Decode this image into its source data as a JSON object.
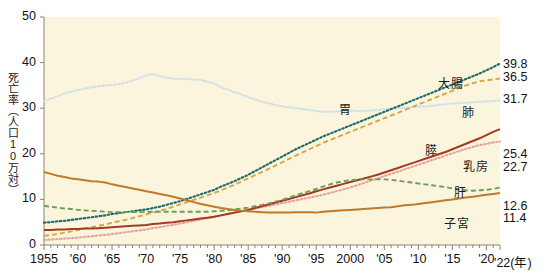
{
  "figure": {
    "background": "#ffffff",
    "plot_background": "#faf5dc",
    "axis_color": "#8a8470"
  },
  "axis": {
    "ylabel": "死亡率（人口10万対）",
    "yticks": [
      "0",
      "10",
      "20",
      "30",
      "40",
      "50"
    ],
    "ylim": [
      0,
      50
    ],
    "xticks": [
      "1955",
      "'60",
      "'65",
      "'70",
      "'75",
      "'80",
      "'85",
      "'90",
      "'95",
      "2000",
      "'05",
      "'10",
      "'15",
      "'20",
      "'22(年)"
    ],
    "xtick_years": [
      1955,
      1960,
      1965,
      1970,
      1975,
      1980,
      1985,
      1990,
      1995,
      2000,
      2005,
      2010,
      2015,
      2020,
      2022
    ],
    "xlim": [
      1955,
      2022
    ],
    "xunit": "(年)",
    "grid": false
  },
  "series_labels": [
    {
      "name": "colorectal-label",
      "text": "大腸",
      "x": 438,
      "y": 74
    },
    {
      "name": "lung-label",
      "text": "肺",
      "x": 462,
      "y": 103
    },
    {
      "name": "stomach-label",
      "text": "胃",
      "x": 339,
      "y": 100
    },
    {
      "name": "pancreas-label",
      "text": "膵",
      "x": 425,
      "y": 141
    },
    {
      "name": "breast-label",
      "text": "乳房",
      "x": 463,
      "y": 157
    },
    {
      "name": "liver-label",
      "text": "肝",
      "x": 454,
      "y": 183
    },
    {
      "name": "uterus-label",
      "text": "子宮",
      "x": 444,
      "y": 214
    }
  ],
  "end_values": [
    {
      "name": "end-value-colorectal",
      "text": "39.8",
      "y": 57
    },
    {
      "name": "end-value-lung",
      "text": "36.5",
      "y": 70
    },
    {
      "name": "end-value-stomach",
      "text": "31.7",
      "y": 92
    },
    {
      "name": "end-value-breast",
      "text": "25.4",
      "y": 147
    },
    {
      "name": "end-value-pancreas",
      "text": "22.7",
      "y": 160
    },
    {
      "name": "end-value-liver",
      "text": "12.6",
      "y": 199
    },
    {
      "name": "end-value-uterus",
      "text": "11.4",
      "y": 211
    }
  ],
  "chart_data": {
    "type": "line",
    "title": "",
    "xlabel": "年",
    "ylabel": "死亡率（人口10万対）",
    "xlim": [
      1955,
      2022
    ],
    "ylim": [
      0,
      50
    ],
    "grid": false,
    "legend": "inline-labels",
    "x": [
      1955,
      1956,
      1957,
      1958,
      1959,
      1960,
      1961,
      1962,
      1963,
      1964,
      1965,
      1966,
      1967,
      1968,
      1969,
      1970,
      1971,
      1972,
      1973,
      1974,
      1975,
      1976,
      1977,
      1978,
      1979,
      1980,
      1981,
      1982,
      1983,
      1984,
      1985,
      1986,
      1987,
      1988,
      1989,
      1990,
      1991,
      1992,
      1993,
      1994,
      1995,
      1996,
      1997,
      1998,
      1999,
      2000,
      2001,
      2002,
      2003,
      2004,
      2005,
      2006,
      2007,
      2008,
      2009,
      2010,
      2011,
      2012,
      2013,
      2014,
      2015,
      2016,
      2017,
      2018,
      2019,
      2020,
      2021,
      2022
    ],
    "series": [
      {
        "name": "胃",
        "name_en": "stomach",
        "color": "#cfe0e8",
        "style": "dotted",
        "end_value": 31.7,
        "values": [
          31.6,
          32.1,
          32.6,
          33.2,
          33.6,
          34.0,
          34.3,
          34.6,
          34.8,
          35.0,
          35.1,
          35.3,
          35.6,
          36.0,
          36.6,
          37.2,
          37.5,
          37.0,
          36.7,
          36.5,
          36.4,
          36.4,
          36.3,
          36.2,
          35.8,
          35.4,
          34.6,
          34.1,
          33.5,
          33.0,
          32.4,
          31.9,
          31.4,
          31.1,
          30.7,
          30.4,
          30.2,
          30.0,
          29.8,
          29.6,
          29.4,
          29.2,
          29.2,
          29.3,
          29.4,
          29.5,
          29.4,
          29.4,
          29.5,
          29.6,
          29.8,
          29.9,
          30.0,
          30.1,
          30.2,
          30.3,
          30.4,
          30.5,
          30.7,
          30.9,
          31.0,
          31.1,
          31.2,
          31.3,
          31.4,
          31.5,
          31.6,
          31.7
        ]
      },
      {
        "name": "大腸",
        "name_en": "colorectal",
        "color": "#1f6b6b",
        "style": "dotted",
        "end_value": 39.8,
        "values": [
          4.9,
          5.0,
          5.2,
          5.3,
          5.5,
          5.7,
          5.9,
          6.1,
          6.3,
          6.5,
          6.8,
          7.0,
          7.2,
          7.4,
          7.6,
          7.8,
          8.1,
          8.4,
          8.8,
          9.2,
          9.6,
          10.1,
          10.6,
          11.1,
          11.6,
          12.1,
          12.8,
          13.4,
          14.0,
          14.7,
          15.4,
          16.2,
          17.0,
          17.8,
          18.6,
          19.4,
          20.2,
          21.0,
          21.7,
          22.4,
          23.1,
          23.8,
          24.4,
          25.0,
          25.6,
          26.2,
          26.8,
          27.4,
          28.0,
          28.6,
          29.2,
          29.8,
          30.4,
          31.0,
          31.6,
          32.2,
          32.8,
          33.4,
          34.0,
          34.6,
          35.2,
          35.8,
          36.4,
          37.0,
          37.6,
          38.3,
          39.0,
          39.8
        ]
      },
      {
        "name": "肺",
        "name_en": "lung",
        "color": "#d9a441",
        "style": "dashed",
        "end_value": 36.5,
        "values": [
          2.0,
          2.2,
          2.4,
          2.7,
          3.0,
          3.3,
          3.6,
          3.9,
          4.2,
          4.5,
          4.9,
          5.2,
          5.5,
          5.9,
          6.3,
          6.7,
          7.1,
          7.5,
          7.9,
          8.4,
          8.9,
          9.4,
          9.9,
          10.4,
          10.9,
          11.4,
          12.0,
          12.6,
          13.2,
          13.9,
          14.6,
          15.3,
          16.0,
          16.7,
          17.4,
          18.1,
          18.9,
          19.6,
          20.3,
          21.0,
          21.7,
          22.4,
          23.0,
          23.6,
          24.2,
          24.8,
          25.4,
          26.0,
          26.6,
          27.2,
          27.8,
          28.4,
          29.0,
          29.6,
          30.2,
          30.8,
          31.4,
          32.0,
          32.6,
          33.2,
          33.8,
          34.4,
          35.0,
          35.5,
          35.9,
          36.1,
          36.3,
          36.5
        ]
      },
      {
        "name": "膵",
        "name_en": "pancreas",
        "color": "#e6a3a3",
        "style": "dotted",
        "end_value": 22.7,
        "values": [
          1.1,
          1.2,
          1.3,
          1.4,
          1.5,
          1.6,
          1.8,
          1.9,
          2.1,
          2.2,
          2.4,
          2.6,
          2.8,
          3.0,
          3.2,
          3.4,
          3.7,
          3.9,
          4.2,
          4.4,
          4.7,
          5.0,
          5.3,
          5.6,
          5.9,
          6.2,
          6.5,
          6.8,
          7.1,
          7.4,
          7.7,
          8.0,
          8.3,
          8.6,
          8.9,
          9.2,
          9.5,
          9.8,
          10.1,
          10.4,
          10.7,
          11.0,
          11.4,
          11.8,
          12.2,
          12.6,
          13.1,
          13.6,
          14.1,
          14.6,
          15.1,
          15.6,
          16.1,
          16.6,
          17.1,
          17.6,
          18.1,
          18.6,
          19.1,
          19.6,
          20.1,
          20.6,
          21.1,
          21.5,
          21.9,
          22.2,
          22.5,
          22.7
        ]
      },
      {
        "name": "乳房",
        "name_en": "breast",
        "color": "#a33a22",
        "style": "solid",
        "end_value": 25.4,
        "values": [
          3.3,
          3.3,
          3.4,
          3.4,
          3.5,
          3.5,
          3.6,
          3.6,
          3.7,
          3.8,
          3.9,
          4.0,
          4.1,
          4.2,
          4.3,
          4.4,
          4.6,
          4.7,
          4.9,
          5.0,
          5.2,
          5.4,
          5.6,
          5.8,
          6.0,
          6.2,
          6.5,
          6.8,
          7.1,
          7.4,
          7.7,
          8.1,
          8.5,
          8.9,
          9.3,
          9.7,
          10.1,
          10.5,
          10.9,
          11.3,
          11.8,
          12.2,
          12.6,
          13.0,
          13.4,
          13.8,
          14.2,
          14.6,
          15.0,
          15.4,
          15.9,
          16.4,
          16.9,
          17.4,
          17.9,
          18.4,
          18.9,
          19.4,
          19.9,
          20.4,
          21.0,
          21.6,
          22.2,
          22.8,
          23.4,
          24.1,
          24.8,
          25.4
        ]
      },
      {
        "name": "肝",
        "name_en": "liver",
        "color": "#6e9e52",
        "style": "dashed",
        "end_value": 12.6,
        "values": [
          8.6,
          8.4,
          8.2,
          8.0,
          7.9,
          7.7,
          7.6,
          7.5,
          7.4,
          7.3,
          7.2,
          7.2,
          7.2,
          7.2,
          7.2,
          7.2,
          7.3,
          7.3,
          7.3,
          7.3,
          7.3,
          7.3,
          7.3,
          7.3,
          7.3,
          7.4,
          7.5,
          7.6,
          7.8,
          8.0,
          8.2,
          8.5,
          8.8,
          9.1,
          9.5,
          9.9,
          10.4,
          10.9,
          11.4,
          11.8,
          12.3,
          12.8,
          13.3,
          13.7,
          14.0,
          14.2,
          14.3,
          14.4,
          14.4,
          14.4,
          14.4,
          14.3,
          14.1,
          13.9,
          13.7,
          13.5,
          13.3,
          13.1,
          12.9,
          12.7,
          12.4,
          12.2,
          12.0,
          11.9,
          12.0,
          12.1,
          12.3,
          12.6
        ]
      },
      {
        "name": "子宮",
        "name_en": "uterus",
        "color": "#c07a2a",
        "style": "solid",
        "end_value": 11.4,
        "values": [
          16.0,
          15.6,
          15.2,
          14.9,
          14.6,
          14.4,
          14.2,
          14.0,
          13.9,
          13.7,
          13.3,
          13.0,
          12.7,
          12.4,
          12.1,
          11.8,
          11.5,
          11.2,
          10.9,
          10.6,
          10.2,
          9.8,
          9.4,
          9.0,
          8.7,
          8.4,
          8.1,
          7.9,
          7.7,
          7.5,
          7.4,
          7.3,
          7.2,
          7.1,
          7.1,
          7.1,
          7.1,
          7.2,
          7.2,
          7.2,
          7.1,
          7.3,
          7.4,
          7.5,
          7.6,
          7.7,
          7.8,
          7.9,
          8.0,
          8.1,
          8.2,
          8.3,
          8.5,
          8.7,
          8.8,
          9.0,
          9.2,
          9.4,
          9.6,
          9.8,
          10.0,
          10.2,
          10.4,
          10.6,
          10.8,
          11.0,
          11.2,
          11.4
        ]
      }
    ]
  }
}
